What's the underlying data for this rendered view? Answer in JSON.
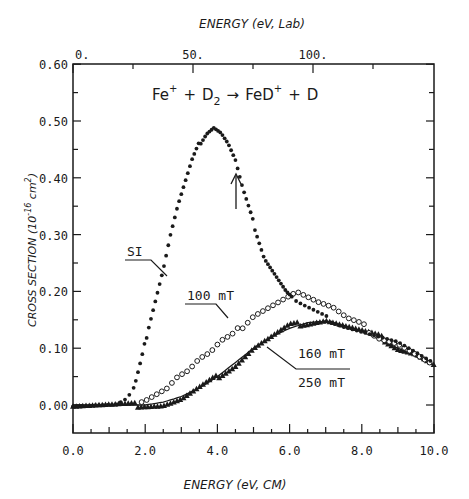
{
  "chart_data": {
    "type": "scatter",
    "reaction": {
      "reactant1": "Fe",
      "reactant1_charge": "+",
      "plus1": "+",
      "reactant2": "D",
      "reactant2_sub": "2",
      "arrow": "→",
      "product1": "FeD",
      "product1_charge": "+",
      "plus2": "+",
      "product2": "D"
    },
    "xlabel": "ENERGY (eV, CM)",
    "x2label": "ENERGY (eV, Lab)",
    "ylabel": "CROSS SECTION (10^-16 cm^2)",
    "ylabel_parts": {
      "main": "CROSS SECTION (10",
      "exp": "-16",
      "unit": " cm",
      "unit_exp": "2",
      "close": ")"
    },
    "xlim": [
      0.0,
      10.0
    ],
    "ylim": [
      -0.05,
      0.6
    ],
    "x_ticks": [
      "0.0",
      "2.0",
      "4.0",
      "6.0",
      "8.0",
      "10.0"
    ],
    "x2_ticks": [
      "0.",
      "50.",
      "100."
    ],
    "y_ticks": [
      "0.00",
      "0.10",
      "0.20",
      "0.30",
      "0.40",
      "0.50",
      "0.60"
    ],
    "grid": false,
    "annotations": [
      {
        "text": "SI",
        "points_to": "SI series"
      },
      {
        "text": "100 mT",
        "points_to": "100 mT series"
      },
      {
        "text": "160 mT",
        "points_to": "160 mT series (triangles)"
      },
      {
        "text": "250 mT",
        "points_to": "250 mT series (solid line)"
      },
      {
        "text": "↑",
        "note": "arrow near x=4.4, y≈0.33-0.40"
      }
    ],
    "series": [
      {
        "name": "SI",
        "marker": "filled-circle",
        "x": [
          0.0,
          0.4,
          0.8,
          1.2,
          1.5,
          1.7,
          1.9,
          2.1,
          2.3,
          2.5,
          2.7,
          2.9,
          3.1,
          3.3,
          3.5,
          3.7,
          3.9,
          4.1,
          4.3,
          4.5,
          4.7,
          4.9,
          5.1,
          5.3,
          5.6,
          5.9,
          6.2,
          6.5,
          6.8,
          7.1,
          7.5,
          8.0,
          8.5,
          9.0,
          9.5,
          10.0
        ],
        "y": [
          0.0,
          0.0,
          0.0,
          0.0,
          0.01,
          0.03,
          0.08,
          0.14,
          0.19,
          0.24,
          0.3,
          0.35,
          0.39,
          0.43,
          0.46,
          0.48,
          0.49,
          0.48,
          0.46,
          0.43,
          0.38,
          0.34,
          0.3,
          0.26,
          0.23,
          0.2,
          0.18,
          0.17,
          0.16,
          0.15,
          0.14,
          0.13,
          0.12,
          0.11,
          0.09,
          0.07
        ]
      },
      {
        "name": "100 mT",
        "marker": "open-circle",
        "x": [
          0.0,
          1.0,
          1.5,
          2.0,
          2.3,
          2.6,
          2.9,
          3.2,
          3.5,
          3.8,
          4.1,
          4.4,
          4.7,
          5.0,
          5.3,
          5.6,
          5.9,
          6.2,
          6.5,
          6.8,
          7.2,
          7.6,
          8.0,
          8.5,
          9.0,
          9.5,
          10.0
        ],
        "y": [
          0.0,
          0.0,
          0.0,
          0.01,
          0.02,
          0.03,
          0.05,
          0.06,
          0.08,
          0.09,
          0.11,
          0.12,
          0.14,
          0.16,
          0.17,
          0.18,
          0.19,
          0.2,
          0.19,
          0.18,
          0.17,
          0.15,
          0.14,
          0.12,
          0.11,
          0.09,
          0.07
        ]
      },
      {
        "name": "160 mT",
        "marker": "filled-triangle",
        "x": [
          0.0,
          1.0,
          2.0,
          2.5,
          3.0,
          3.5,
          4.0,
          4.5,
          5.0,
          5.5,
          6.0,
          6.5,
          7.0,
          7.5,
          8.0,
          8.5,
          9.0,
          9.5,
          10.0
        ],
        "y": [
          0.0,
          0.0,
          0.0,
          0.0,
          0.01,
          0.03,
          0.05,
          0.07,
          0.1,
          0.12,
          0.14,
          0.145,
          0.15,
          0.14,
          0.13,
          0.12,
          0.1,
          0.09,
          0.07
        ]
      },
      {
        "name": "250 mT",
        "marker": "line",
        "x": [
          0.0,
          1.0,
          2.0,
          2.5,
          3.0,
          3.5,
          4.0,
          4.5,
          5.0,
          5.5,
          6.0,
          6.5,
          7.0,
          7.5,
          8.0,
          8.5,
          9.0,
          9.5,
          10.0
        ],
        "y": [
          0.0,
          0.0,
          0.0,
          0.005,
          0.015,
          0.03,
          0.05,
          0.075,
          0.1,
          0.12,
          0.135,
          0.145,
          0.148,
          0.14,
          0.13,
          0.115,
          0.1,
          0.085,
          0.07
        ]
      }
    ]
  },
  "layout": {
    "plot": {
      "left": 73,
      "top": 64,
      "right": 434,
      "bottom": 433
    },
    "y_zero_px": 405,
    "y_unit_px": 568,
    "x_unit_px": 36.1,
    "ink_color": "#1a1a1a"
  }
}
